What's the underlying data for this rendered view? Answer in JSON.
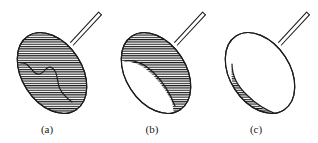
{
  "figure": {
    "background_color": "#ffffff",
    "line_color": "#1d1d1a",
    "hatch_color": "#1d1d1d",
    "hatch_spacing_px": 2.3,
    "caption_font_size_px": 11,
    "panels": [
      {
        "id": "a",
        "caption": "(a)",
        "caption_x": 47,
        "caption_y": 133,
        "fill_state": "full",
        "fill_description": "entire ellipse hatched, internal wavy crack line across lower-left region",
        "has_internal_curve": true,
        "internal_curve_type": "wavy-crack",
        "ellipse": {
          "cx": 52,
          "cy": 73,
          "rx": 30,
          "ry": 44,
          "rotation_deg": -33
        },
        "handle": {
          "x1": 72,
          "y1": 40,
          "x2": 100,
          "y2": 10,
          "width": 3.4
        }
      },
      {
        "id": "b",
        "caption": "(b)",
        "caption_x": 152,
        "caption_y": 133,
        "fill_state": "partial-upper",
        "fill_description": "upper and right portion hatched, large white circular void in lower-left",
        "has_internal_curve": true,
        "internal_curve_type": "large-arc",
        "ellipse": {
          "cx": 156,
          "cy": 73,
          "rx": 30,
          "ry": 44,
          "rotation_deg": -33
        },
        "handle": {
          "x1": 176,
          "y1": 40,
          "x2": 204,
          "y2": 10,
          "width": 3.4
        }
      },
      {
        "id": "c",
        "caption": "(c)",
        "caption_x": 256,
        "caption_y": 133,
        "fill_state": "partial-lower",
        "fill_description": "lower-left crescent hatched, remainder white",
        "has_internal_curve": true,
        "internal_curve_type": "crescent-arc",
        "ellipse": {
          "cx": 260,
          "cy": 73,
          "rx": 30,
          "ry": 44,
          "rotation_deg": -33
        },
        "handle": {
          "x1": 280,
          "y1": 40,
          "x2": 308,
          "y2": 10,
          "width": 3.4
        }
      }
    ]
  }
}
